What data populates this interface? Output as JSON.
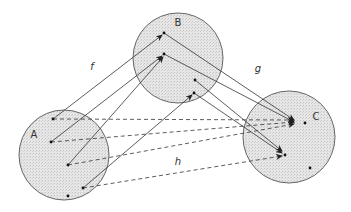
{
  "diagram": {
    "type": "function-composition",
    "colors": {
      "fill": "#e2e2e2",
      "stroke": "#666666",
      "line": "#333333",
      "dot": "#111111"
    },
    "sets": [
      {
        "id": "A",
        "label": "A",
        "cx": 64,
        "cy": 155,
        "r": 45,
        "label_x": 34,
        "label_y": 138,
        "points": [
          {
            "x": 53,
            "y": 119
          },
          {
            "x": 51,
            "y": 142
          },
          {
            "x": 68,
            "y": 165
          },
          {
            "x": 83,
            "y": 188
          },
          {
            "x": 68,
            "y": 196
          }
        ]
      },
      {
        "id": "B",
        "label": "B",
        "cx": 178,
        "cy": 58,
        "r": 45,
        "label_x": 178,
        "label_y": 26,
        "points": [
          {
            "x": 164,
            "y": 33
          },
          {
            "x": 164,
            "y": 54
          },
          {
            "x": 195,
            "y": 80
          },
          {
            "x": 194,
            "y": 93
          }
        ]
      },
      {
        "id": "C",
        "label": "C",
        "cx": 289,
        "cy": 137,
        "r": 46,
        "label_x": 316,
        "label_y": 120,
        "points": [
          {
            "x": 305,
            "y": 123
          },
          {
            "x": 285,
            "y": 155
          },
          {
            "x": 310,
            "y": 168
          }
        ]
      }
    ],
    "maps": [
      {
        "label": "f",
        "x": 92,
        "y": 70
      },
      {
        "label": "g",
        "x": 258,
        "y": 72
      },
      {
        "label": "h",
        "x": 178,
        "y": 165
      }
    ],
    "arrows": [
      {
        "map": "f",
        "style": "solid",
        "from": [
          53,
          119
        ],
        "to": [
          162,
          35
        ]
      },
      {
        "map": "f",
        "style": "solid",
        "from": [
          51,
          142
        ],
        "to": [
          162,
          56
        ]
      },
      {
        "map": "f",
        "style": "solid",
        "from": [
          68,
          165
        ],
        "to": [
          163,
          57
        ]
      },
      {
        "map": "f",
        "style": "solid",
        "from": [
          83,
          188
        ],
        "to": [
          192,
          95
        ]
      },
      {
        "map": "g",
        "style": "solid",
        "from": [
          164,
          33
        ],
        "to": [
          294,
          120
        ]
      },
      {
        "map": "g",
        "style": "solid",
        "from": [
          164,
          54
        ],
        "to": [
          294,
          122
        ]
      },
      {
        "map": "g",
        "style": "solid",
        "from": [
          195,
          80
        ],
        "to": [
          282,
          151
        ]
      },
      {
        "map": "g",
        "style": "solid",
        "from": [
          194,
          93
        ],
        "to": [
          282,
          153
        ]
      },
      {
        "map": "h",
        "style": "dashed",
        "from": [
          53,
          119
        ],
        "to": [
          294,
          120
        ]
      },
      {
        "map": "h",
        "style": "dashed",
        "from": [
          51,
          142
        ],
        "to": [
          294,
          122
        ]
      },
      {
        "map": "h",
        "style": "dashed",
        "from": [
          68,
          165
        ],
        "to": [
          294,
          124
        ]
      },
      {
        "map": "h",
        "style": "dashed",
        "from": [
          83,
          188
        ],
        "to": [
          282,
          156
        ]
      }
    ]
  }
}
